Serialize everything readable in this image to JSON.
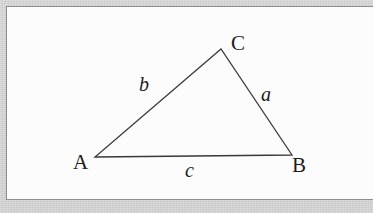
{
  "figure": {
    "kind": "geometry-diagram",
    "colors": {
      "surround": "#c6c6c6",
      "plate": "#fdfdfd",
      "frame_line": "#8e8e8e",
      "stroke": "#3a3a3a",
      "text": "#1d1d1d"
    },
    "stroke_width": 1.3,
    "vertices": [
      {
        "name": "A",
        "label": "A",
        "x": 95,
        "y": 157
      },
      {
        "name": "B",
        "label": "B",
        "x": 292,
        "y": 155
      },
      {
        "name": "C",
        "label": "C",
        "x": 221,
        "y": 49
      }
    ],
    "sides": [
      {
        "name": "a",
        "label": "a",
        "from": "B",
        "to": "C",
        "label_x": 261,
        "label_y": 84
      },
      {
        "name": "b",
        "label": "b",
        "from": "A",
        "to": "C",
        "label_x": 139,
        "label_y": 74
      },
      {
        "name": "c",
        "label": "c",
        "from": "A",
        "to": "B",
        "label_x": 185,
        "label_y": 160
      }
    ],
    "path": "M 95,157 L 221,49 L 292,155 Z"
  }
}
